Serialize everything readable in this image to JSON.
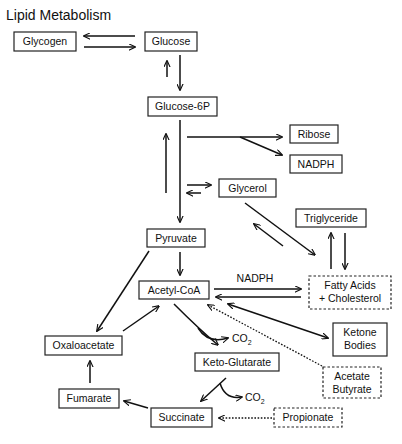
{
  "title": "Lipid Metabolism",
  "nodes": {
    "glycogen": {
      "label": "Glycogen",
      "style": "solid"
    },
    "glucose": {
      "label": "Glucose",
      "style": "solid"
    },
    "glucose6p": {
      "label": "Glucose-6P",
      "style": "solid"
    },
    "ribose": {
      "label": "Ribose",
      "style": "solid"
    },
    "nadph": {
      "label": "NADPH",
      "style": "solid"
    },
    "glycerol": {
      "label": "Glycerol",
      "style": "solid"
    },
    "triglyceride": {
      "label": "Triglyceride",
      "style": "solid"
    },
    "pyruvate": {
      "label": "Pyruvate",
      "style": "solid"
    },
    "acetylcoa": {
      "label": "Acetyl-CoA",
      "style": "solid"
    },
    "fattyacids_line1": {
      "label": "Fatty Acids",
      "style": "dashed"
    },
    "fattyacids_line2": {
      "label": "+ Cholesterol",
      "style": "dashed"
    },
    "ketone_line1": {
      "label": "Ketone",
      "style": "solid"
    },
    "ketone_line2": {
      "label": "Bodies",
      "style": "solid"
    },
    "oxaloacetate": {
      "label": "Oxaloacetate",
      "style": "solid"
    },
    "ketoglutarate": {
      "label": "Keto-Glutarate",
      "style": "solid"
    },
    "acetate_line1": {
      "label": "Acetate",
      "style": "dashed"
    },
    "acetate_line2": {
      "label": "Butyrate",
      "style": "dashed"
    },
    "fumarate": {
      "label": "Fumarate",
      "style": "solid"
    },
    "succinate": {
      "label": "Succinate",
      "style": "solid"
    },
    "propionate": {
      "label": "Propionate",
      "style": "dashed"
    }
  },
  "edge_labels": {
    "nadph_synthesis": "NADPH",
    "co2_1_base": "CO",
    "co2_1_sub": "2",
    "co2_2_base": "CO",
    "co2_2_sub": "2"
  },
  "edges": [
    {
      "from": "Glucose",
      "to": "Glycogen",
      "style": "solid"
    },
    {
      "from": "Glycogen",
      "to": "Glucose",
      "style": "solid"
    },
    {
      "from": "Glucose",
      "to": "Glucose-6P",
      "style": "solid"
    },
    {
      "from": "Glucose-6P",
      "to": "Glucose",
      "style": "solid"
    },
    {
      "from": "Glucose-6P",
      "to": "Pyruvate",
      "style": "solid"
    },
    {
      "from": "Pyruvate",
      "to": "Glucose-6P",
      "style": "solid"
    },
    {
      "from": "Glucose-6P",
      "to": "Ribose",
      "style": "solid"
    },
    {
      "from": "Glucose-6P",
      "to": "NADPH",
      "style": "solid"
    },
    {
      "from": "Glucose-6P/Pyruvate",
      "to": "Glycerol",
      "style": "solid"
    },
    {
      "from": "Glycerol",
      "to": "Glucose-6P/Pyruvate",
      "style": "solid"
    },
    {
      "from": "Glycerol",
      "to": "Fatty Acids + Cholesterol",
      "style": "solid"
    },
    {
      "from": "Fatty Acids + Cholesterol",
      "to": "Glycerol",
      "style": "solid"
    },
    {
      "from": "Fatty Acids + Cholesterol",
      "to": "Triglyceride",
      "style": "solid"
    },
    {
      "from": "Triglyceride",
      "to": "Fatty Acids + Cholesterol",
      "style": "solid"
    },
    {
      "from": "Pyruvate",
      "to": "Acetyl-CoA",
      "style": "solid"
    },
    {
      "from": "Pyruvate",
      "to": "Oxaloacetate",
      "style": "solid"
    },
    {
      "from": "Acetyl-CoA",
      "to": "Fatty Acids + Cholesterol",
      "label": "NADPH",
      "style": "solid"
    },
    {
      "from": "Fatty Acids + Cholesterol",
      "to": "Acetyl-CoA",
      "style": "solid"
    },
    {
      "from": "Acetyl-CoA",
      "to": "Ketone Bodies",
      "style": "solid",
      "bidirectional": true
    },
    {
      "from": "Acetate Butyrate",
      "to": "Acetyl-CoA",
      "style": "dotted"
    },
    {
      "from": "Oxaloacetate",
      "to": "Acetyl-CoA",
      "style": "solid"
    },
    {
      "from": "Acetyl-CoA",
      "to": "Keto-Glutarate",
      "side_product": "CO2",
      "style": "solid"
    },
    {
      "from": "Keto-Glutarate",
      "to": "Succinate",
      "side_product": "CO2",
      "style": "solid"
    },
    {
      "from": "Succinate",
      "to": "Fumarate",
      "style": "solid"
    },
    {
      "from": "Fumarate",
      "to": "Oxaloacetate",
      "style": "solid"
    },
    {
      "from": "Propionate",
      "to": "Succinate",
      "style": "dotted"
    }
  ]
}
